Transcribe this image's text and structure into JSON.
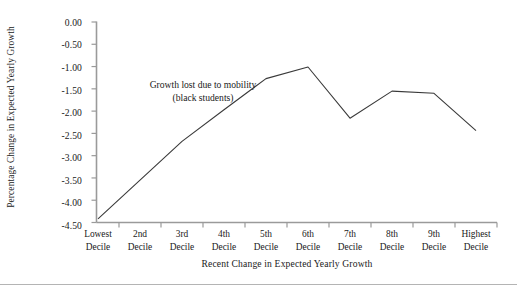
{
  "chart_data": {
    "type": "line",
    "title": "",
    "subtitle": "",
    "xlabel": "Recent Change in Expected Yearly Growth",
    "ylabel": "Percentage Change in Expected Yearly Growth",
    "categories": [
      "Lowest Decile",
      "2nd Decile",
      "3rd Decile",
      "4th Decile",
      "5th Decile",
      "6th Decile",
      "7th Decile",
      "8th Decile",
      "9th Decile",
      "Highest Decile"
    ],
    "category_lines": [
      [
        "Lowest",
        "Decile"
      ],
      [
        "2nd",
        "Decile"
      ],
      [
        "3rd",
        "Decile"
      ],
      [
        "4th",
        "Decile"
      ],
      [
        "5th",
        "Decile"
      ],
      [
        "6th",
        "Decile"
      ],
      [
        "7th",
        "Decile"
      ],
      [
        "8th",
        "Decile"
      ],
      [
        "9th",
        "Decile"
      ],
      [
        "Highest",
        "Decile"
      ]
    ],
    "series": [
      {
        "name": "Growth lost due to mobility (black students)",
        "values": [
          -4.42,
          -3.55,
          -2.68,
          -1.97,
          -1.27,
          -1.01,
          -2.16,
          -1.55,
          -1.6,
          -2.44
        ]
      }
    ],
    "annotations": [
      {
        "line1": "Growth lost due to mobility",
        "line2": "(black students)"
      }
    ],
    "ylim": [
      -4.5,
      0.0
    ],
    "ytick_labels": [
      "0.00",
      "-0.50",
      "-1.00",
      "-1.50",
      "-2.00",
      "-2.50",
      "-3.00",
      "-3.50",
      "-4.00",
      "-4.50"
    ],
    "ytick_values": [
      0.0,
      -0.5,
      -1.0,
      -1.5,
      -2.0,
      -2.5,
      -3.0,
      -3.5,
      -4.0,
      -4.5
    ],
    "grid": false,
    "legend_position": "none",
    "line_color": "#3a3a3a",
    "axis_color": "#9a9a9a",
    "background_color": "#ffffff"
  },
  "footer": {
    "rule": ""
  }
}
